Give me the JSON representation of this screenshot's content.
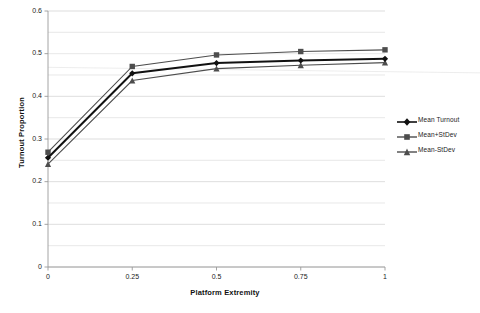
{
  "chart_data": {
    "type": "line",
    "title": "",
    "xlabel": "Platform Extremity",
    "ylabel": "Turnout Proportion",
    "x": [
      0,
      0.25,
      0.5,
      0.75,
      1
    ],
    "xtick_labels": [
      "0",
      "0.25",
      "0.5",
      "0.75",
      "1"
    ],
    "ytick_labels": [
      "0",
      "0.1",
      "0.2",
      "0.3",
      "0.4",
      "0.5",
      "0.6"
    ],
    "ytick_values": [
      0,
      0.1,
      0.2,
      0.3,
      0.4,
      0.5,
      0.6
    ],
    "xlim": [
      0,
      1
    ],
    "ylim": [
      0,
      0.6
    ],
    "grid": "horizontal-minor-0.05",
    "legend_position": "right",
    "series": [
      {
        "name": "Mean Turnout",
        "marker": "diamond",
        "color": "#111111",
        "values": [
          0.256,
          0.454,
          0.478,
          0.484,
          0.488
        ]
      },
      {
        "name": "Mean+StDev",
        "marker": "square",
        "color": "#4d4d4d",
        "values": [
          0.269,
          0.47,
          0.497,
          0.505,
          0.509
        ]
      },
      {
        "name": "Mean-StDev",
        "marker": "triangle",
        "color": "#4d4d4d",
        "values": [
          0.241,
          0.437,
          0.465,
          0.473,
          0.479
        ]
      }
    ]
  },
  "axes": {
    "y_title": "Turnout Proportion",
    "x_title": "Platform Extremity",
    "y_ticks": [
      "0.6",
      "0.5",
      "0.4",
      "0.3",
      "0.2",
      "0.1",
      "0"
    ],
    "x_ticks": [
      "0",
      "0.25",
      "0.5",
      "0.75",
      "1"
    ]
  },
  "legend": {
    "items": [
      {
        "label": "Mean Turnout"
      },
      {
        "label": "Mean+StDev"
      },
      {
        "label": "Mean-StDev"
      }
    ]
  },
  "colors": {
    "series_primary": "#111111",
    "series_secondary": "#4d4d4d",
    "gridline": "#d9d9d9",
    "axis": "#9a9a9a",
    "background": "#ffffff"
  }
}
